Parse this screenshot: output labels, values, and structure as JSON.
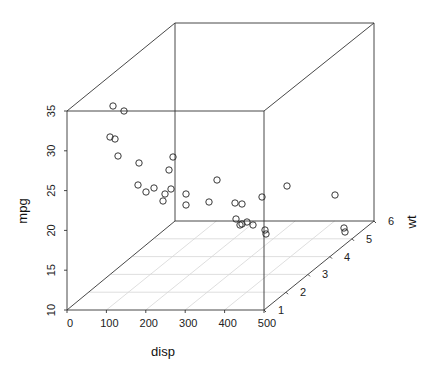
{
  "chart_data": {
    "type": "scatter3d",
    "title": "",
    "xlabel": "disp",
    "ylabel": "wt",
    "zlabel": "mpg",
    "xlim": [
      0,
      500
    ],
    "ylim": [
      1,
      6
    ],
    "zlim": [
      10,
      35
    ],
    "x_ticks": [
      "0",
      "100",
      "200",
      "300",
      "400",
      "500"
    ],
    "y_ticks": [
      "1",
      "2",
      "3",
      "4",
      "5",
      "6"
    ],
    "z_ticks": [
      "10",
      "15",
      "20",
      "25",
      "30",
      "35"
    ],
    "grid": "floor",
    "point_style": "open-circle",
    "points": [
      {
        "disp": 71.1,
        "wt": 1.835,
        "mpg": 33.9
      },
      {
        "disp": 75.7,
        "wt": 1.615,
        "mpg": 30.4
      },
      {
        "disp": 78.7,
        "wt": 2.2,
        "mpg": 32.4
      },
      {
        "disp": 79.0,
        "wt": 1.935,
        "mpg": 27.3
      },
      {
        "disp": 95.1,
        "wt": 1.513,
        "mpg": 30.4
      },
      {
        "disp": 108.0,
        "wt": 2.32,
        "mpg": 22.8
      },
      {
        "disp": 120.1,
        "wt": 2.465,
        "mpg": 21.5
      },
      {
        "disp": 120.3,
        "wt": 2.14,
        "mpg": 26.0
      },
      {
        "disp": 121.0,
        "wt": 2.78,
        "mpg": 21.4
      },
      {
        "disp": 140.8,
        "wt": 3.15,
        "mpg": 22.8
      },
      {
        "disp": 145.0,
        "wt": 2.77,
        "mpg": 19.7
      },
      {
        "disp": 146.7,
        "wt": 3.19,
        "mpg": 24.4
      },
      {
        "disp": 160.0,
        "wt": 2.62,
        "mpg": 21.0
      },
      {
        "disp": 160.0,
        "wt": 2.875,
        "mpg": 21.0
      },
      {
        "disp": 167.6,
        "wt": 3.44,
        "mpg": 19.2
      },
      {
        "disp": 167.6,
        "wt": 3.44,
        "mpg": 17.8
      },
      {
        "disp": 225.0,
        "wt": 3.46,
        "mpg": 18.1
      },
      {
        "disp": 258.0,
        "wt": 3.215,
        "mpg": 21.4
      },
      {
        "disp": 275.8,
        "wt": 4.07,
        "mpg": 16.4
      },
      {
        "disp": 275.8,
        "wt": 3.73,
        "mpg": 17.3
      },
      {
        "disp": 275.8,
        "wt": 3.78,
        "mpg": 15.2
      },
      {
        "disp": 301.0,
        "wt": 3.57,
        "mpg": 15.0
      },
      {
        "disp": 304.0,
        "wt": 3.435,
        "mpg": 15.2
      },
      {
        "disp": 318.0,
        "wt": 3.52,
        "mpg": 15.5
      },
      {
        "disp": 350.0,
        "wt": 3.84,
        "mpg": 13.3
      },
      {
        "disp": 351.0,
        "wt": 3.17,
        "mpg": 15.8
      },
      {
        "disp": 360.0,
        "wt": 3.44,
        "mpg": 18.7
      },
      {
        "disp": 360.0,
        "wt": 3.57,
        "mpg": 14.3
      },
      {
        "disp": 400.0,
        "wt": 3.845,
        "mpg": 19.2
      },
      {
        "disp": 440.0,
        "wt": 5.345,
        "mpg": 14.7
      },
      {
        "disp": 460.0,
        "wt": 5.424,
        "mpg": 10.4
      },
      {
        "disp": 472.0,
        "wt": 5.25,
        "mpg": 10.4
      }
    ]
  },
  "screen": {
    "points_px": [
      [
        113,
        106
      ],
      [
        124,
        111
      ],
      [
        110,
        137
      ],
      [
        115,
        139
      ],
      [
        118,
        156
      ],
      [
        139,
        163
      ],
      [
        173,
        157
      ],
      [
        169,
        170
      ],
      [
        138,
        185
      ],
      [
        146,
        192
      ],
      [
        154,
        188
      ],
      [
        171,
        189
      ],
      [
        165,
        194
      ],
      [
        163,
        201
      ],
      [
        186,
        194
      ],
      [
        186,
        205
      ],
      [
        217,
        180
      ],
      [
        209,
        202
      ],
      [
        235,
        203
      ],
      [
        242,
        204
      ],
      [
        262,
        197
      ],
      [
        287,
        186
      ],
      [
        335,
        195
      ],
      [
        236,
        219
      ],
      [
        240,
        225
      ],
      [
        242,
        224
      ],
      [
        247,
        222
      ],
      [
        253,
        225
      ],
      [
        265,
        230
      ],
      [
        266,
        234
      ],
      [
        344,
        228
      ],
      [
        345,
        232
      ]
    ]
  }
}
